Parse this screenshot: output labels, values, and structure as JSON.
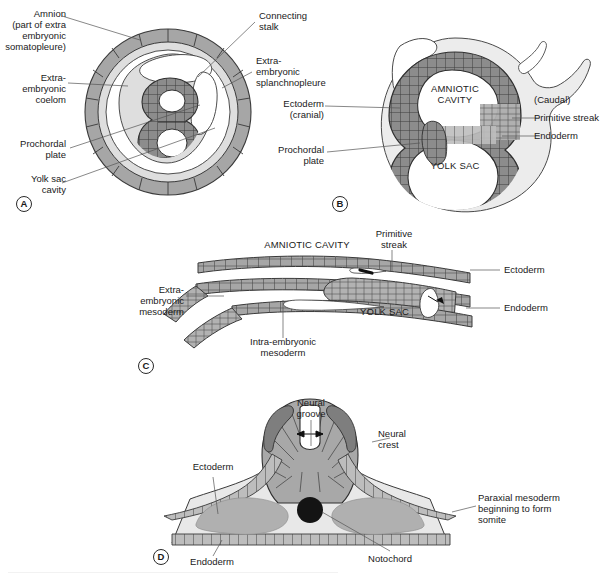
{
  "figure": {
    "background": "#ffffff",
    "colors": {
      "cell_dark": "#7e7e7e",
      "cell_mid": "#a6a6a6",
      "cell_light": "#d4d4d4",
      "tissue_pale": "#e4e4e4",
      "mesoderm_blob": "#b0b0b0",
      "notochord": "#141414",
      "stroke": "#3a3a3a",
      "leader": "#555555"
    }
  },
  "panels": [
    {
      "tag": "A",
      "labels_left": [
        {
          "name": "amnion",
          "text": "Amnion\n(part of extra\nembryonic\nsomatopleure)"
        },
        {
          "name": "extra-embryonic-coelom",
          "text": "Extra-\nembryonic\ncoelom"
        },
        {
          "name": "prochordal-plate",
          "text": "Prochordal\nplate"
        },
        {
          "name": "yolk-sac-cavity",
          "text": "Yolk sac\ncavity"
        }
      ],
      "labels_right": [
        {
          "name": "connecting-stalk",
          "text": "Connecting\nstalk"
        },
        {
          "name": "extra-embryonic-splanchnopleure",
          "text": "Extra-\nembryonic\nsplanchnopleure"
        }
      ]
    },
    {
      "tag": "B",
      "labels_left": [
        {
          "name": "ectoderm-cranial",
          "text": "Ectoderm\n(cranial)"
        },
        {
          "name": "prochordal-plate",
          "text": "Prochordal\nplate"
        }
      ],
      "labels_right": [
        {
          "name": "caudal",
          "text": "(Caudal)"
        },
        {
          "name": "primitive-streak",
          "text": "Primitive streak"
        },
        {
          "name": "endoderm",
          "text": "Endoderm"
        }
      ],
      "labels_inner": [
        {
          "name": "amniotic-cavity",
          "text": "AMNIOTIC\nCAVITY"
        },
        {
          "name": "yolk-sac",
          "text": "YOLK SAC"
        }
      ]
    },
    {
      "tag": "C",
      "labels_left": [
        {
          "name": "extra-embryonic-mesoderm",
          "text": "Extra-\nembryonic\nmesoderm"
        }
      ],
      "labels_right": [
        {
          "name": "ectoderm",
          "text": "Ectoderm"
        },
        {
          "name": "endoderm",
          "text": "Endoderm"
        }
      ],
      "labels_inner": [
        {
          "name": "amniotic-cavity",
          "text": "AMNIOTIC CAVITY"
        },
        {
          "name": "yolk-sac",
          "text": "YOLK SAC"
        },
        {
          "name": "primitive-streak",
          "text": "Primitive\nstreak"
        },
        {
          "name": "intra-embryonic-mesoderm",
          "text": "Intra-embryonic\nmesoderm"
        }
      ]
    },
    {
      "tag": "D",
      "labels_left": [
        {
          "name": "ectoderm",
          "text": "Ectoderm"
        },
        {
          "name": "endoderm",
          "text": "Endoderm"
        }
      ],
      "labels_right": [
        {
          "name": "neural-crest",
          "text": "Neural\ncrest"
        },
        {
          "name": "paraxial-mesoderm",
          "text": "Paraxial mesoderm\nbeginning to form\nsomite"
        }
      ],
      "labels_inner": [
        {
          "name": "neural-groove",
          "text": "Neural\ngroove"
        },
        {
          "name": "notochord",
          "text": "Notochord"
        }
      ]
    }
  ]
}
